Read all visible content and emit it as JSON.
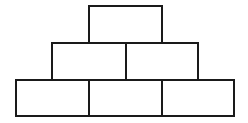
{
  "diagram": {
    "type": "number-pyramid",
    "rows": 3,
    "stroke_color": "#1a1a1a",
    "background": "#ffffff",
    "bricks": [
      {
        "row": 0,
        "col": 0,
        "label": "",
        "x": 88,
        "y": 5,
        "w": 75,
        "h": 39
      },
      {
        "row": 1,
        "col": 0,
        "label": "",
        "x": 51,
        "y": 42,
        "w": 76,
        "h": 39
      },
      {
        "row": 1,
        "col": 1,
        "label": "",
        "x": 125,
        "y": 42,
        "w": 74,
        "h": 39
      },
      {
        "row": 2,
        "col": 0,
        "label": "",
        "x": 15,
        "y": 79,
        "w": 75,
        "h": 38
      },
      {
        "row": 2,
        "col": 1,
        "label": "",
        "x": 88,
        "y": 79,
        "w": 75,
        "h": 38
      },
      {
        "row": 2,
        "col": 2,
        "label": "",
        "x": 161,
        "y": 79,
        "w": 74,
        "h": 38
      }
    ]
  }
}
